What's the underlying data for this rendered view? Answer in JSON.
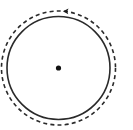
{
  "diagram": {
    "type": "circular-motion",
    "canvas": {
      "width": 133,
      "height": 130,
      "background": "#ffffff"
    },
    "center": {
      "cx": 58.5,
      "cy": 68
    },
    "center_dot": {
      "r": 2.6,
      "color": "#111111"
    },
    "solid_circle": {
      "r": 51.5,
      "stroke": "#2a2a2a",
      "stroke_width": 1.6
    },
    "dashed_circle": {
      "r": 57,
      "stroke": "#2a2a2a",
      "stroke_width": 1.6,
      "dash": "4 3.2"
    },
    "arrow": {
      "direction": "counterclockwise",
      "position": "top",
      "tip": {
        "x": 63,
        "y": 11.2
      },
      "color": "#1a1a1a"
    }
  }
}
